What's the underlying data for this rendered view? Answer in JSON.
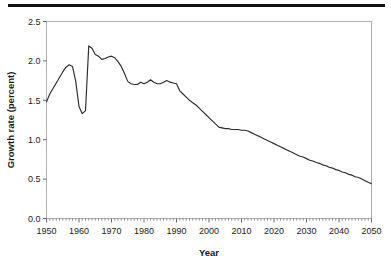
{
  "figure": {
    "name": "population-growth-rate-figure",
    "top_rule_color": "#111111",
    "background_color": "#ffffff"
  },
  "chart_data": {
    "type": "line",
    "title": "",
    "subtitle": "",
    "xlabel": "Year",
    "ylabel": "Growth rate (percent)",
    "xlim": [
      1950,
      2050
    ],
    "ylim": [
      0.0,
      2.5
    ],
    "xticks": [
      1950,
      1960,
      1970,
      1980,
      1990,
      2000,
      2010,
      2020,
      2030,
      2040,
      2050
    ],
    "xtick_labels": [
      "1950",
      "1960",
      "1970",
      "1980",
      "1990",
      "2000",
      "2010",
      "2020",
      "2030",
      "2040",
      "2050"
    ],
    "yticks": [
      0.0,
      0.5,
      1.0,
      1.5,
      2.0,
      2.5
    ],
    "ytick_labels": [
      "0.0",
      "0.5",
      "1.0",
      "1.5",
      "2.0",
      "2.5"
    ],
    "x_minor_tick_interval": 1,
    "grid": false,
    "legend": null,
    "legend_position": "none",
    "series_color": "#2b2b2b",
    "frame_color": "#b0b0b0",
    "annotations": [],
    "x": [
      1950,
      1951,
      1952,
      1953,
      1954,
      1955,
      1956,
      1957,
      1958,
      1959,
      1960,
      1961,
      1962,
      1963,
      1964,
      1965,
      1966,
      1967,
      1968,
      1969,
      1970,
      1971,
      1972,
      1973,
      1974,
      1975,
      1976,
      1977,
      1978,
      1979,
      1980,
      1981,
      1982,
      1983,
      1984,
      1985,
      1986,
      1987,
      1988,
      1989,
      1990,
      1991,
      1992,
      1993,
      1994,
      1995,
      1996,
      1997,
      1998,
      1999,
      2000,
      2001,
      2002,
      2003,
      2004,
      2005,
      2006,
      2007,
      2008,
      2009,
      2010,
      2011,
      2012,
      2013,
      2014,
      2015,
      2016,
      2017,
      2018,
      2019,
      2020,
      2021,
      2022,
      2023,
      2024,
      2025,
      2026,
      2027,
      2028,
      2029,
      2030,
      2031,
      2032,
      2033,
      2034,
      2035,
      2036,
      2037,
      2038,
      2039,
      2040,
      2041,
      2042,
      2043,
      2044,
      2045,
      2046,
      2047,
      2048,
      2049,
      2050
    ],
    "values": [
      1.48,
      1.58,
      1.65,
      1.72,
      1.79,
      1.86,
      1.92,
      1.95,
      1.93,
      1.74,
      1.42,
      1.33,
      1.37,
      2.19,
      2.16,
      2.08,
      2.06,
      2.02,
      2.03,
      2.05,
      2.06,
      2.04,
      1.99,
      1.93,
      1.84,
      1.74,
      1.71,
      1.7,
      1.7,
      1.73,
      1.71,
      1.73,
      1.76,
      1.73,
      1.71,
      1.71,
      1.73,
      1.75,
      1.73,
      1.72,
      1.71,
      1.62,
      1.58,
      1.54,
      1.5,
      1.47,
      1.44,
      1.4,
      1.36,
      1.32,
      1.28,
      1.24,
      1.2,
      1.16,
      1.15,
      1.14,
      1.14,
      1.13,
      1.13,
      1.13,
      1.12,
      1.12,
      1.11,
      1.09,
      1.07,
      1.05,
      1.03,
      1.01,
      0.99,
      0.97,
      0.95,
      0.93,
      0.91,
      0.89,
      0.87,
      0.85,
      0.83,
      0.81,
      0.79,
      0.78,
      0.76,
      0.74,
      0.73,
      0.71,
      0.7,
      0.68,
      0.67,
      0.65,
      0.64,
      0.62,
      0.61,
      0.59,
      0.58,
      0.56,
      0.55,
      0.53,
      0.52,
      0.5,
      0.48,
      0.46,
      0.44
    ]
  }
}
